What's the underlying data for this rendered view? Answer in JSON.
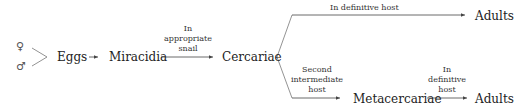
{
  "diagram": {
    "symbols": {
      "female": "♀",
      "male": "♂"
    },
    "nodes": {
      "eggs": "Eggs",
      "miracidia": "Miracidia",
      "cercariae": "Cercariae",
      "adults_top": "Adults",
      "metacercariae": "Metacercariae",
      "adults_bottom": "Adults"
    },
    "edge_labels": {
      "miracidia_to_cercariae": [
        "In",
        "appropriate",
        "snail"
      ],
      "cercariae_to_adults": "In definitive host",
      "cercariae_to_metacercariae": [
        "Second",
        "intermediate",
        "host"
      ],
      "metacercariae_to_adults": [
        "In",
        "definitive",
        "host"
      ]
    },
    "colors": {
      "text": "#222222",
      "line": "#555555",
      "background": "#ffffff"
    }
  }
}
